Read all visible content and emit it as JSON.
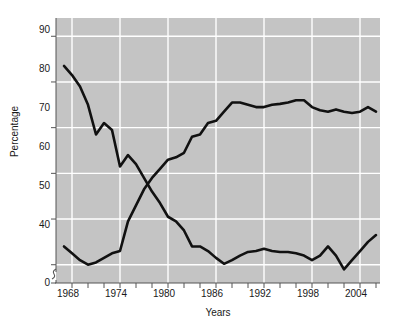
{
  "chart_data": {
    "type": "line",
    "title": "",
    "subtitle": "",
    "xlabel": "Years",
    "ylabel": "Percentage",
    "xlim": [
      1966.0,
      2006.5
    ],
    "ylim": [
      36.0,
      94.0
    ],
    "y_axis_break": true,
    "y_axis_break_label": "0",
    "grid": true,
    "grid_axes": "both",
    "legend": "inline-annotations",
    "plot_background": "#c4c4c4",
    "gridline_color": "#ffffff",
    "line_color": "#111111",
    "y_ticks": [
      40,
      50,
      60,
      70,
      80,
      90
    ],
    "y_tick_labels": [
      "40",
      "50",
      "60",
      "70",
      "80",
      "90"
    ],
    "x_ticks_major": [
      1968,
      1974,
      1980,
      1986,
      1992,
      1998,
      2004
    ],
    "x_tick_labels": [
      "1968",
      "1974",
      "1980",
      "1986",
      "1992",
      "1998",
      "2004"
    ],
    "x_minor_tick_step": 2,
    "x": [
      1967,
      1968,
      1969,
      1970,
      1971,
      1972,
      1973,
      1974,
      1975,
      1976,
      1977,
      1978,
      1979,
      1980,
      1981,
      1982,
      1983,
      1984,
      1985,
      1986,
      1987,
      1988,
      1989,
      1990,
      1991,
      1992,
      1993,
      1994,
      1995,
      1996,
      1997,
      1998,
      1999,
      2000,
      2001,
      2002,
      2003,
      2004,
      2005,
      2006
    ],
    "series": [
      {
        "name": "Develop a meaningful philosophy of life",
        "annotation": [
          "Develop a meaningful",
          "philosophy of life"
        ],
        "values": [
          83.5,
          81.5,
          79.0,
          75.0,
          68.5,
          71.0,
          69.5,
          61.5,
          64.0,
          62.0,
          59.0,
          56.0,
          53.5,
          50.5,
          49.5,
          47.5,
          44.0,
          44.0,
          43.0,
          41.5,
          40.2,
          41.0,
          42.0,
          42.8,
          43.0,
          43.5,
          43.0,
          42.8,
          42.8,
          42.5,
          42.0,
          41.0,
          42.0,
          44.0,
          42.0,
          39.0,
          41.0,
          43.0,
          45.0,
          46.5
        ]
      },
      {
        "name": "Be very well off financially",
        "annotation": [
          "Be very",
          "well off financially"
        ],
        "values": [
          44.0,
          42.5,
          41.0,
          40.0,
          40.5,
          41.5,
          42.5,
          43.0,
          49.5,
          53.0,
          56.5,
          59.0,
          61.0,
          63.0,
          63.5,
          64.5,
          68.0,
          68.5,
          71.0,
          71.5,
          73.5,
          75.5,
          75.5,
          75.0,
          74.5,
          74.5,
          75.0,
          75.2,
          75.5,
          76.0,
          76.0,
          74.5,
          73.8,
          73.5,
          74.0,
          73.5,
          73.2,
          73.5,
          74.5,
          73.5
        ]
      }
    ]
  }
}
